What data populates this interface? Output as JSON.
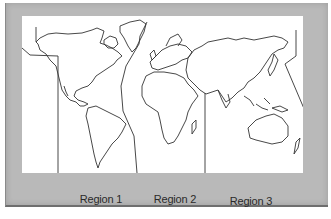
{
  "figure": {
    "type": "world-map-regions",
    "background_color": "#b9b9b9",
    "map_background": "#ffffff",
    "line_color": "#333333",
    "regions": [
      {
        "label": "Region 1"
      },
      {
        "label": "Region 2"
      },
      {
        "label": "Region 3"
      }
    ]
  }
}
